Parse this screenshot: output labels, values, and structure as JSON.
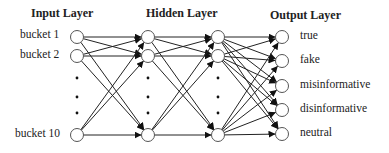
{
  "headers": {
    "input": "Input Layer",
    "hidden": "Hidden Layer",
    "output": "Output Layer"
  },
  "input_labels": [
    "bucket 1",
    "bucket 2",
    "bucket 10"
  ],
  "output_labels": [
    "true",
    "fake",
    "misinformative",
    "disinformative",
    "neutral"
  ],
  "ellipsis": "⋮",
  "layers": [
    {
      "name": "input",
      "x": 77,
      "nodes": [
        37,
        56,
        135
      ],
      "dots": [
        78,
        97,
        113
      ]
    },
    {
      "name": "hidden1",
      "x": 148,
      "nodes": [
        37,
        56,
        135
      ],
      "dots": [
        78,
        97,
        113
      ]
    },
    {
      "name": "hidden2",
      "x": 218,
      "nodes": [
        37,
        56,
        135
      ],
      "dots": [
        78,
        97,
        113
      ]
    },
    {
      "name": "output",
      "x": 282,
      "nodes": [
        37,
        61,
        86,
        110,
        134
      ],
      "dots": []
    }
  ],
  "colors": {
    "line": "#222222",
    "node_fill": "#ffffff",
    "node_stroke": "#555555"
  }
}
